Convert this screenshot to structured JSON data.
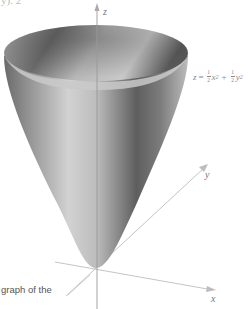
{
  "figure": {
    "top_fragment": "y).  2",
    "equation": {
      "lhs": "z",
      "term1_coef_num": "1",
      "term1_coef_den": "2",
      "term1_var": "x",
      "term1_exp": "2",
      "op": "+",
      "term2_coef_num": "1",
      "term2_coef_den": "2",
      "term2_var": "y",
      "term2_exp": "2"
    },
    "axes": {
      "z_label": "z",
      "y_label": "y",
      "x_label": "x"
    },
    "caption_fragment": "graph of the",
    "colors": {
      "axis": "#b5b5b5",
      "surface_dark": "#555555",
      "surface_light": "#d8d8d8",
      "label": "#777777"
    }
  }
}
